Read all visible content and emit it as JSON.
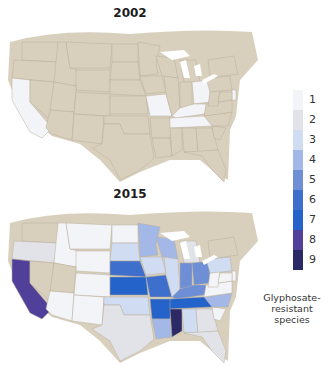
{
  "maps": [
    {
      "title": "2002",
      "base_color": "#d9cfbd",
      "states": {
        "CA": 1,
        "MO": 1,
        "OH": 1,
        "KY": 1,
        "TN": 1,
        "DE": 1
      }
    },
    {
      "title": "2015",
      "base_color": "#d9cfbd",
      "states": {
        "WA": 0,
        "OR": 2,
        "CA": 8,
        "NV": 0,
        "ID": 1,
        "MT": 1,
        "WY": 1,
        "UT": 0,
        "AZ": 1,
        "CO": 1,
        "NM": 1,
        "ND": 1,
        "SD": 3,
        "NE": 6,
        "KS": 7,
        "OK": 3,
        "TX": 2,
        "MN": 4,
        "IA": 3,
        "MO": 6,
        "AR": 7,
        "LA": 4,
        "WI": 4,
        "IL": 3,
        "MS": 9,
        "MI": 2,
        "IN": 5,
        "OH": 5,
        "KY": 5,
        "TN": 7,
        "AL": 3,
        "GA": 2,
        "FL": 2,
        "SC": 1,
        "NC": 4,
        "VA": 1,
        "WV": 1,
        "PA": 3,
        "NY": 0,
        "DE": 1,
        "MD": 1
      }
    }
  ],
  "legend": {
    "levels": [
      1,
      2,
      3,
      4,
      5,
      6,
      7,
      8,
      9
    ],
    "colors": [
      "#f3f4f8",
      "#e2e3e8",
      "#cfdcf2",
      "#a3b8e6",
      "#6e8fd6",
      "#3f6fcc",
      "#2463c9",
      "#50409a",
      "#2c2a66"
    ],
    "caption_lines": [
      "Glyphosate-",
      "resistant",
      "species"
    ]
  }
}
